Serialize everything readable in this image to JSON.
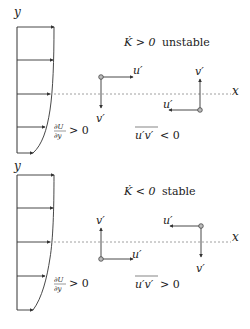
{
  "figure": {
    "axis_labels": {
      "y": "y",
      "x": "x"
    },
    "colors": {
      "line": "#333333",
      "dashed": "#888888",
      "text": "#222222"
    }
  },
  "panels": [
    {
      "id": "unstable",
      "title_symbol": "K̇ > 0",
      "title_word": "unstable",
      "gradient_num": "∂U",
      "gradient_den": "∂y",
      "gradient_rel": "> 0",
      "stress_symbol": "u′v′",
      "stress_rel": "< 0",
      "vectors": [
        {
          "u_label": "u′",
          "v_label": "v′",
          "u_dir": "right",
          "v_dir": "down"
        },
        {
          "u_label": "u′",
          "v_label": "v′",
          "u_dir": "left",
          "v_dir": "up"
        }
      ]
    },
    {
      "id": "stable",
      "title_symbol": "K̇ < 0",
      "title_word": "stable",
      "gradient_num": "∂U",
      "gradient_den": "∂y",
      "gradient_rel": "> 0",
      "stress_symbol": "u′v′",
      "stress_rel": "> 0",
      "vectors": [
        {
          "u_label": "u′",
          "v_label": "v′",
          "u_dir": "right",
          "v_dir": "up"
        },
        {
          "u_label": "u′",
          "v_label": "v′",
          "u_dir": "left",
          "v_dir": "down"
        }
      ]
    }
  ]
}
